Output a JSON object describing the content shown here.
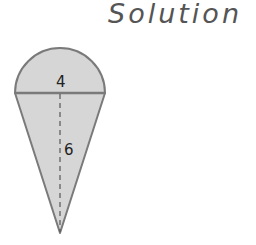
{
  "header": {
    "title": "Solution"
  },
  "figure": {
    "semicircle_label": "4",
    "triangle_height_label": "6",
    "colors": {
      "fill": "#d6d6d6",
      "stroke": "#7a7a7a",
      "dash": "#555555"
    }
  }
}
